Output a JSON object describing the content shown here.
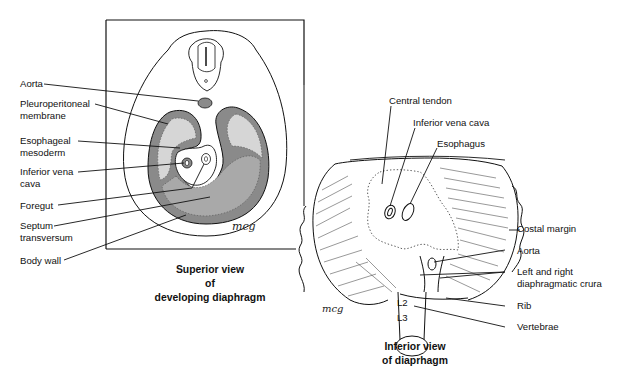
{
  "figure": {
    "left_panel": {
      "caption": [
        "Superior view",
        "of",
        "developing diaphragm"
      ],
      "labels": [
        {
          "id": "aorta",
          "text": "Aorta"
        },
        {
          "id": "pleuroperitoneal",
          "text": "Pleuroperitoneal\nmembrane"
        },
        {
          "id": "esophageal",
          "text": "Esophageal\nmesoderm"
        },
        {
          "id": "ivc",
          "text": "Inferior vena\ncava"
        },
        {
          "id": "foregut",
          "text": "Foregut"
        },
        {
          "id": "septum",
          "text": "Septum\ntransversum"
        },
        {
          "id": "bodywall",
          "text": "Body wall"
        }
      ],
      "signature": "mcg"
    },
    "right_panel": {
      "caption": [
        "Inferior view",
        "of diaprhagm"
      ],
      "labels": [
        {
          "id": "central_tendon",
          "text": "Central tendon"
        },
        {
          "id": "ivc",
          "text": "Inferior vena cava"
        },
        {
          "id": "esophagus",
          "text": "Esophagus"
        },
        {
          "id": "costal_margin",
          "text": "Costal margin"
        },
        {
          "id": "aorta",
          "text": "Aorta"
        },
        {
          "id": "crura",
          "text": "Left and right\ndiaphragmatic crura"
        },
        {
          "id": "rib",
          "text": "Rib"
        },
        {
          "id": "vertebrae",
          "text": "Vertebrae"
        }
      ],
      "vertebra_labels": [
        "L2",
        "L3"
      ],
      "signature": "mcg"
    },
    "colors": {
      "dark_gray": "#8a8a8a",
      "mid_gray": "#a9a9a9",
      "light_gray": "#d6d6d6",
      "line": "#111111"
    }
  }
}
